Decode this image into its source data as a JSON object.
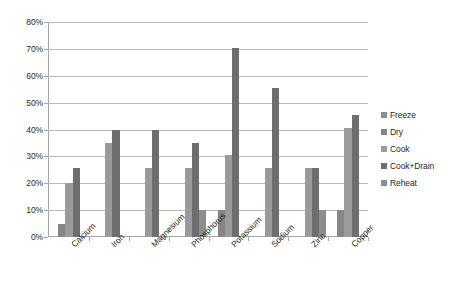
{
  "chart_data": {
    "type": "bar",
    "title": "",
    "xlabel": "",
    "ylabel": "",
    "ylim": [
      0,
      80
    ],
    "ytick_labels": [
      "0%",
      "10%",
      "20%",
      "30%",
      "40%",
      "50%",
      "60%",
      "70%",
      "80%"
    ],
    "ytick_values": [
      0,
      10,
      20,
      30,
      40,
      50,
      60,
      70,
      80
    ],
    "grid": true,
    "legend_position": "right",
    "categories": [
      "Calcium",
      "Iron",
      "Magnesium",
      "Phosphorus",
      "Potassium",
      "Sodium",
      "Zinc",
      "Copper"
    ],
    "series": [
      {
        "name": "Freeze",
        "color": "#8d8d8d",
        "values": [
          0,
          0,
          0,
          0,
          0,
          0,
          0,
          0
        ]
      },
      {
        "name": "Dry",
        "color": "#868686",
        "values": [
          5,
          0,
          0,
          0,
          10,
          0,
          0,
          10
        ]
      },
      {
        "name": "Cook",
        "color": "#9b9b9b",
        "values": [
          20,
          35,
          25.5,
          25.5,
          30.5,
          25.5,
          25.5,
          40.5
        ]
      },
      {
        "name": "Cook+Drain",
        "color": "#6e6e6e",
        "values": [
          25.5,
          40,
          40,
          35,
          70.5,
          55.5,
          25.5,
          45.5
        ]
      },
      {
        "name": "Reheat",
        "color": "#8d8d8d",
        "values": [
          0,
          0,
          0,
          10,
          0,
          0,
          10,
          0
        ]
      }
    ]
  },
  "legend": {
    "items": [
      {
        "label": "Freeze",
        "color": "#8d8d8d"
      },
      {
        "label": "Dry",
        "color": "#868686"
      },
      {
        "label": "Cook",
        "color": "#9b9b9b"
      },
      {
        "label": "Cook+Drain",
        "color": "#6e6e6e"
      },
      {
        "label": "Reheat",
        "color": "#8d8d8d"
      }
    ]
  }
}
